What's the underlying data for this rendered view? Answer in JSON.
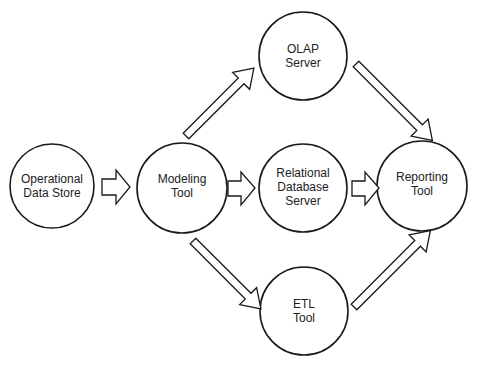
{
  "diagram": {
    "nodes": [
      {
        "id": "ods",
        "label_lines": [
          "Operational",
          "Data Store"
        ]
      },
      {
        "id": "modeling",
        "label_lines": [
          "Modeling",
          "Tool"
        ]
      },
      {
        "id": "olap",
        "label_lines": [
          "OLAP",
          "Server"
        ]
      },
      {
        "id": "rdbms",
        "label_lines": [
          "Relational",
          "Database",
          "Server"
        ]
      },
      {
        "id": "etl",
        "label_lines": [
          "ETL",
          "Tool"
        ]
      },
      {
        "id": "reporting",
        "label_lines": [
          "Reporting",
          "Tool"
        ]
      }
    ],
    "edges": [
      {
        "from": "ods",
        "to": "modeling"
      },
      {
        "from": "modeling",
        "to": "olap"
      },
      {
        "from": "modeling",
        "to": "rdbms"
      },
      {
        "from": "modeling",
        "to": "etl"
      },
      {
        "from": "olap",
        "to": "reporting"
      },
      {
        "from": "rdbms",
        "to": "reporting"
      },
      {
        "from": "etl",
        "to": "reporting"
      }
    ],
    "colors": {
      "stroke": "#1a1a1a",
      "fill": "#ffffff"
    }
  }
}
